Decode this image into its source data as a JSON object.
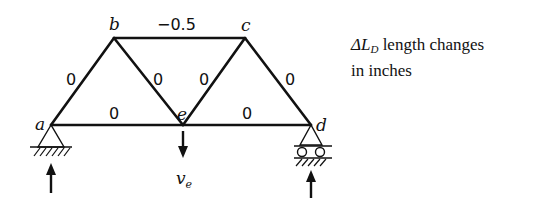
{
  "diagram": {
    "type": "truss",
    "nodes": [
      {
        "id": "a",
        "label": "a",
        "x": 51,
        "y": 125
      },
      {
        "id": "b",
        "label": "b",
        "x": 114,
        "y": 38
      },
      {
        "id": "c",
        "label": "c",
        "x": 245,
        "y": 38
      },
      {
        "id": "d",
        "label": "d",
        "x": 311,
        "y": 125
      },
      {
        "id": "e",
        "label": "e",
        "x": 183,
        "y": 125
      }
    ],
    "members": [
      {
        "from": "a",
        "to": "b",
        "value": "0"
      },
      {
        "from": "b",
        "to": "c",
        "value": "−0.5"
      },
      {
        "from": "b",
        "to": "e",
        "value": "0"
      },
      {
        "from": "c",
        "to": "e",
        "value": "0"
      },
      {
        "from": "c",
        "to": "d",
        "value": "0"
      },
      {
        "from": "a",
        "to": "e",
        "value": "0"
      },
      {
        "from": "e",
        "to": "d",
        "value": "0"
      }
    ],
    "supports": [
      {
        "node": "a",
        "type": "pin"
      },
      {
        "node": "d",
        "type": "roller"
      }
    ],
    "load": {
      "node": "e",
      "label_main": "v",
      "label_sub": "e",
      "direction": "down"
    },
    "legend": {
      "symbol": "ΔL",
      "subscript": "D",
      "line1_rest": " length changes",
      "line2": "in inches"
    }
  }
}
